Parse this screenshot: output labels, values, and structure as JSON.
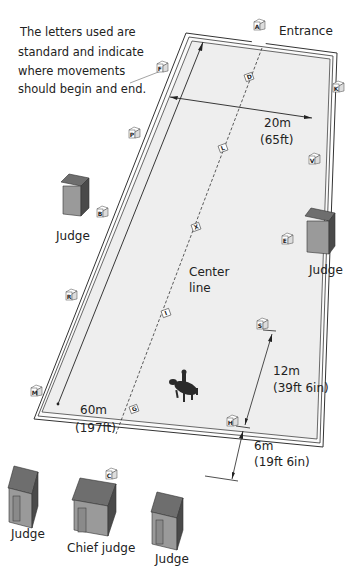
{
  "annotation": {
    "lines": [
      "The letters used are",
      "standard and indicate",
      "where movements",
      "should begin and end."
    ]
  },
  "labels": {
    "entrance": "Entrance",
    "width_m": "20m",
    "width_ft": "(65ft)",
    "length_m": "60m",
    "length_ft": "(197ft)",
    "center_line_1": "Center",
    "center_line_2": "line",
    "spacing_12_m": "12m",
    "spacing_12_ft": "(39ft 6in)",
    "spacing_6_m": "6m",
    "spacing_6_ft": "(19ft 6in)"
  },
  "judges": {
    "left_side": "Judge",
    "right_side": "Judge",
    "bottom_left": "Judge",
    "bottom_center": "Chief judge",
    "bottom_right": "Judge"
  },
  "markers": {
    "outer": {
      "A": "A",
      "K": "K",
      "V": "V",
      "E": "E",
      "S": "S",
      "H": "H",
      "C": "C",
      "M": "M",
      "R": "R",
      "B": "B",
      "P": "P",
      "F": "F"
    },
    "center": {
      "D": "D",
      "L": "L",
      "X": "X",
      "I": "I",
      "G": "G"
    }
  },
  "colors": {
    "arena_fill": "#eeeeee",
    "arena_border": "#333333",
    "hut_roof": "#6e6e6e",
    "hut_wall": "#9a9a9a",
    "hut_side": "#4a4a4a",
    "text": "#222222"
  }
}
